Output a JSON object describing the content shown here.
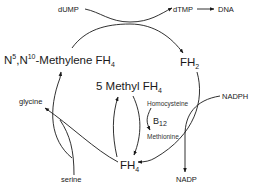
{
  "diagram": {
    "nodes": {
      "dump": "dUMP",
      "dtmp": "dTMP",
      "dna": "DNA",
      "methylene_prefix_n": "N",
      "methylene_sup1": "5",
      "methylene_comma_n": ",N",
      "methylene_sup2": "10",
      "methylene_text": "-Methylene FH",
      "methylene_sub": "4",
      "fh2_text": "FH",
      "fh2_sub": "2",
      "methyl_text": "5 Methyl FH",
      "methyl_sub": "4",
      "fh4_text": "FH",
      "fh4_sub": "4",
      "homocysteine": "Homocysteine",
      "b12_text": "B",
      "b12_sub": "12",
      "methionine": "Methionine",
      "nadph": "NADPH",
      "nadp": "NADP",
      "glycine": "glycine",
      "serine": "serine"
    },
    "edges": [
      {
        "from": "dUMP",
        "to": "dTMP"
      },
      {
        "from": "dTMP",
        "to": "DNA"
      },
      {
        "from": "N5,N10-Methylene FH4",
        "to": "FH2"
      },
      {
        "from": "FH2",
        "to": "FH4",
        "cofactor": "NADPH -> NADP"
      },
      {
        "from": "FH4",
        "to": "N5,N10-Methylene FH4",
        "cofactor": "serine -> glycine"
      },
      {
        "from": "N5,N10-Methylene FH4",
        "to": "5 Methyl FH4"
      },
      {
        "from": "5 Methyl FH4",
        "to": "FH4",
        "cofactor": "B12; Homocysteine -> Methionine"
      }
    ],
    "colors": {
      "line": "#1a1a1a",
      "background": "#ffffff"
    }
  }
}
